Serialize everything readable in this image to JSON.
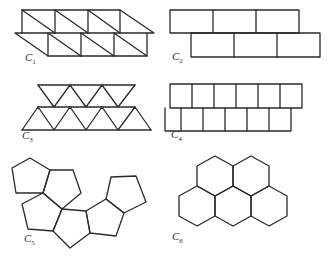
{
  "figure": {
    "panels": [
      {
        "id": "C1",
        "label": "C",
        "sub": "1",
        "shape": "squares divided by diagonals into right triangles, two offset rows"
      },
      {
        "id": "C2",
        "label": "C",
        "sub": "2",
        "shape": "rectangles in two offset brick rows"
      },
      {
        "id": "C3",
        "label": "C",
        "sub": "3",
        "shape": "equilateral triangles in two rows"
      },
      {
        "id": "C4",
        "label": "C",
        "sub": "4",
        "shape": "squares in two offset rows"
      },
      {
        "id": "C5",
        "label": "C",
        "sub": "5",
        "shape": "cluster of regular pentagons"
      },
      {
        "id": "C6",
        "label": "C",
        "sub": "6",
        "shape": "cluster of five regular hexagons"
      }
    ]
  },
  "colors": {
    "stroke": "#2a2a2a",
    "background": "#ffffff"
  }
}
